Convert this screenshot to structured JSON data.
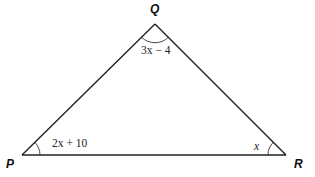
{
  "diagram": {
    "type": "triangle",
    "vertices": [
      {
        "name": "P",
        "label": "P"
      },
      {
        "name": "Q",
        "label": "Q"
      },
      {
        "name": "R",
        "label": "R"
      }
    ],
    "angles": {
      "P": "2x + 10",
      "Q": "3x − 4",
      "R": "x"
    },
    "colors": {
      "stroke": "#222222",
      "background": "#ffffff"
    }
  }
}
